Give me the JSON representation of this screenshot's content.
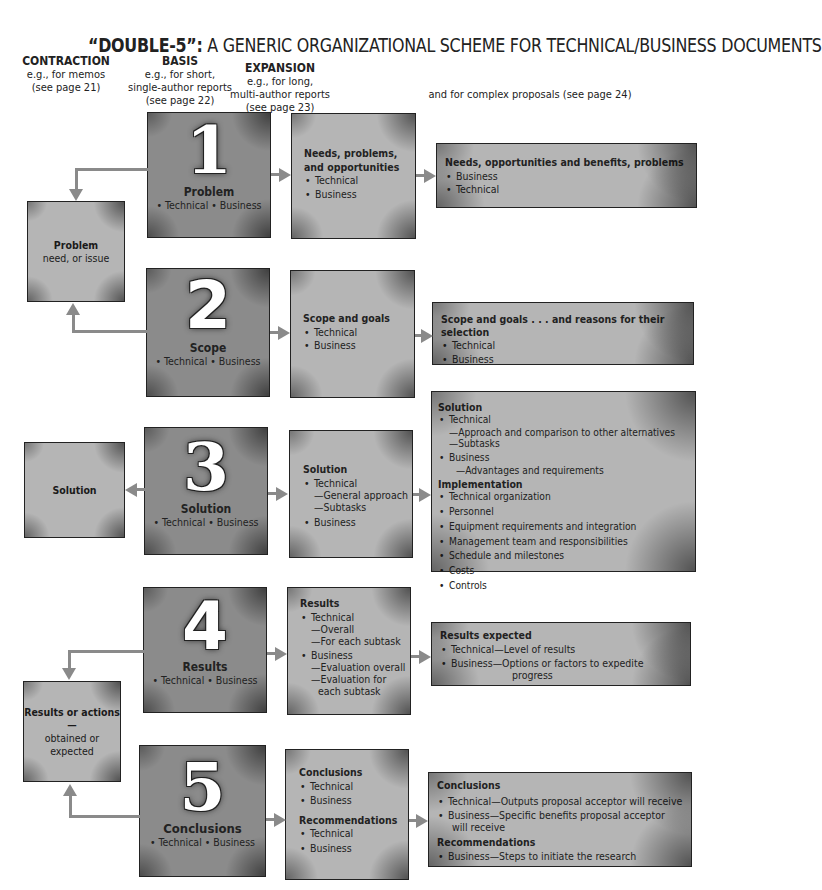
{
  "title": {
    "prefix": "“DOUBLE-5”:",
    "text": " A GENERIC ORGANIZATIONAL SCHEME FOR TECHNICAL/BUSINESS DOCUMENTS"
  },
  "columns": {
    "contraction": {
      "heading": "CONTRACTION",
      "line1": "e.g., for memos",
      "line2": "(see page 21)"
    },
    "basis": {
      "heading": "BASIS",
      "line1": "e.g., for short,",
      "line2": "single-author reports",
      "line3": "(see page 22)"
    },
    "expansion": {
      "heading": "EXPANSION",
      "line1": "e.g., for long,",
      "line2": "multi-author reports",
      "line3": "(see page 23)"
    },
    "proposals": {
      "line1": "and for complex proposals (see page 24)"
    }
  },
  "contraction_boxes": [
    {
      "title": "Problem",
      "subtitle": "need, or issue"
    },
    {
      "title": "Solution"
    },
    {
      "title": "Results or actions—",
      "subtitle1": "obtained or",
      "subtitle2": "expected"
    }
  ],
  "basis_boxes": [
    {
      "number": "1",
      "label": "Problem",
      "bullets": "• Technical   • Business"
    },
    {
      "number": "2",
      "label": "Scope",
      "bullets": "• Technical   • Business"
    },
    {
      "number": "3",
      "label": "Solution",
      "bullets": "• Technical   • Business"
    },
    {
      "number": "4",
      "label": "Results",
      "bullets": "• Technical   • Business"
    },
    {
      "number": "5",
      "label": "Conclusions",
      "bullets": "• Technical   • Business"
    }
  ],
  "expansion_boxes": [
    {
      "heading1": "Needs, problems,",
      "heading2": "and opportunities",
      "items": [
        "Technical",
        "Business"
      ]
    },
    {
      "heading": "Scope and goals",
      "items": [
        "Technical",
        "Business"
      ]
    },
    {
      "heading": "Solution",
      "items": [
        "Technical",
        "—General approach",
        "—Subtasks",
        "Business"
      ]
    },
    {
      "heading": "Results",
      "items": [
        "Technical",
        "—Overall",
        "—For each subtask",
        "Business",
        "—Evaluation overall",
        "—Evaluation for",
        "each subtask"
      ]
    },
    {
      "heading": "Conclusions",
      "items": [
        "Technical",
        "Business"
      ],
      "heading2": "Recommendations",
      "items2": [
        "Technical",
        "Business"
      ]
    }
  ],
  "proposal_boxes": [
    {
      "heading": "Needs, opportunities and benefits, problems",
      "items": [
        "Business",
        "Technical"
      ]
    },
    {
      "heading": "Scope and goals . . . and reasons for their selection",
      "items": [
        "Technical",
        "Business"
      ]
    },
    {
      "heading": "Solution",
      "items": [
        "Technical",
        "—Approach and comparison to other alternatives",
        "—Subtasks",
        "Business",
        "—Advantages and requirements"
      ],
      "heading2": "Implementation",
      "items2": [
        "Technical organization",
        "Personnel",
        "Equipment requirements and integration",
        "Management team and responsibilities",
        "Schedule and milestones",
        "Costs",
        "Controls"
      ]
    },
    {
      "heading": "Results expected",
      "items": [
        "Technical—Level of results",
        "Business—Options or factors to expedite",
        "progress"
      ]
    },
    {
      "heading": "Conclusions",
      "items": [
        "Technical—Outputs proposal acceptor will receive",
        "Business—Specific benefits proposal acceptor",
        "will receive"
      ],
      "heading2": "Recommendations",
      "items2": [
        "Business—Steps to initiate the research"
      ]
    }
  ],
  "colors": {
    "dark_box": "#8b8b8b",
    "light_box": "#b5b5b5",
    "arrow": "#8a8a8a",
    "border": "#222222"
  }
}
